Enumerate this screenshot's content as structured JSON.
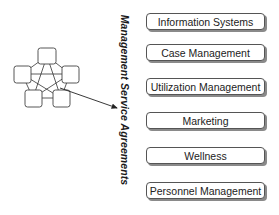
{
  "diagram": {
    "vertical_label": "Management Service Agreements",
    "network": {
      "nodes": [
        {
          "id": "top",
          "x": 38,
          "y": 48,
          "w": 18,
          "h": 16
        },
        {
          "id": "left",
          "x": 14,
          "y": 66,
          "w": 17,
          "h": 17
        },
        {
          "id": "right",
          "x": 62,
          "y": 66,
          "w": 17,
          "h": 17
        },
        {
          "id": "bottom-left",
          "x": 25,
          "y": 90,
          "w": 17,
          "h": 17
        },
        {
          "id": "bottom-right",
          "x": 53,
          "y": 90,
          "w": 17,
          "h": 17
        }
      ],
      "arrow": {
        "from": [
          60,
          90
        ],
        "to": [
          118,
          108
        ]
      }
    },
    "boxes": [
      {
        "label": "Information Systems",
        "top": 13
      },
      {
        "label": "Case Management",
        "top": 44
      },
      {
        "label": "Utilization Management",
        "top": 78
      },
      {
        "label": "Marketing",
        "top": 112
      },
      {
        "label": "Wellness",
        "top": 147
      },
      {
        "label": "Personnel Management",
        "top": 182
      }
    ]
  }
}
